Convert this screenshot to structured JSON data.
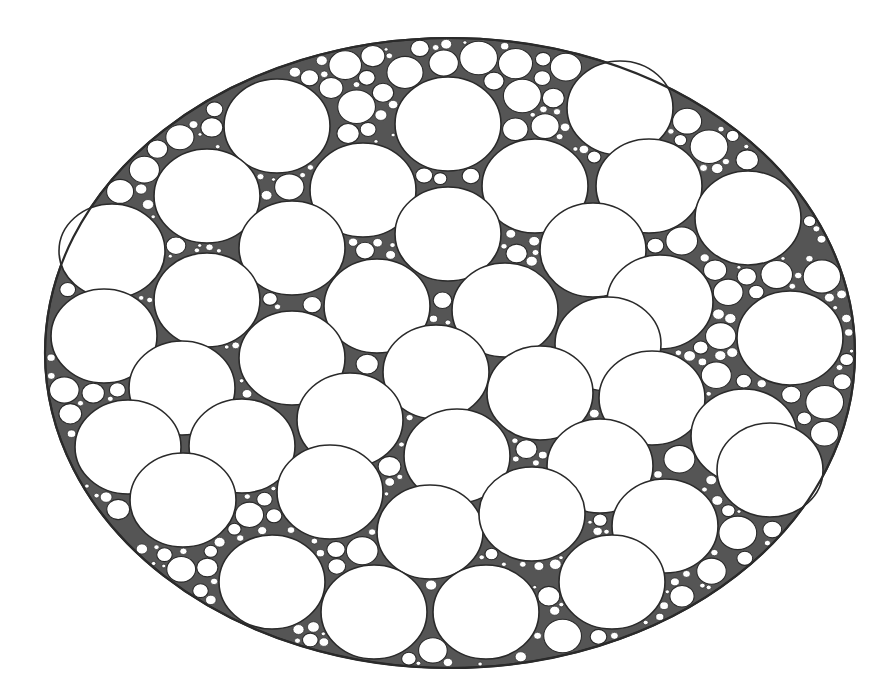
{
  "diagram": {
    "type": "circle-packing",
    "colors": {
      "stroke": "#2a2a2a",
      "fill": "#ffffff",
      "background": "#ffffff",
      "gap_fill": "#555555"
    },
    "outer": {
      "cx": 450,
      "cy": 353,
      "rx": 405,
      "ry": 315
    },
    "large_circle_size": {
      "rx": 53,
      "ry": 47
    },
    "large_circles": [
      [
        277,
        126
      ],
      [
        448,
        124
      ],
      [
        620,
        108
      ],
      [
        207,
        196
      ],
      [
        363,
        190
      ],
      [
        535,
        186
      ],
      [
        649,
        186
      ],
      [
        748,
        218
      ],
      [
        112,
        251
      ],
      [
        292,
        248
      ],
      [
        448,
        234
      ],
      [
        593,
        250
      ],
      [
        207,
        300
      ],
      [
        377,
        306
      ],
      [
        505,
        310
      ],
      [
        660,
        302
      ],
      [
        104,
        336
      ],
      [
        790,
        338
      ],
      [
        182,
        388
      ],
      [
        292,
        358
      ],
      [
        436,
        372
      ],
      [
        608,
        344
      ],
      [
        128,
        447
      ],
      [
        242,
        446
      ],
      [
        350,
        420
      ],
      [
        457,
        456
      ],
      [
        540,
        393
      ],
      [
        652,
        398
      ],
      [
        744,
        436
      ],
      [
        183,
        500
      ],
      [
        330,
        492
      ],
      [
        600,
        466
      ],
      [
        770,
        470
      ],
      [
        430,
        532
      ],
      [
        532,
        514
      ],
      [
        665,
        526
      ],
      [
        272,
        582
      ],
      [
        374,
        612
      ],
      [
        486,
        612
      ],
      [
        612,
        582
      ]
    ]
  },
  "caption": {
    "text": ""
  }
}
